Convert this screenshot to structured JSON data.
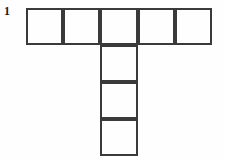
{
  "figure": {
    "label": "1",
    "label_name": "problem-number",
    "caption": "",
    "background_color": "#fefefe",
    "line_color": "#3a3a3a",
    "line_width": 1.6
  },
  "chart_data": {
    "type": "diagram",
    "subtype": "polyomino-net",
    "title": "",
    "xlabel": "",
    "ylabel": "",
    "grid": false,
    "legend": null,
    "cell_size": 37,
    "origin": {
      "x": 26,
      "y": 8
    },
    "xlim": [
      26,
      212
    ],
    "ylim": [
      8,
      156
    ],
    "rows": [
      {
        "name": "top-row",
        "count": 5,
        "row_index": 0,
        "col_start": 0
      },
      {
        "name": "stem-row-1",
        "count": 1,
        "row_index": 1,
        "col_start": 2
      },
      {
        "name": "stem-row-2",
        "count": 1,
        "row_index": 2,
        "col_start": 2
      },
      {
        "name": "stem-row-3",
        "count": 1,
        "row_index": 3,
        "col_start": 2
      }
    ],
    "cells": [
      {
        "id": "cell-r0c0",
        "row": 0,
        "col": 0,
        "x": 26,
        "y": 8,
        "w": 37,
        "h": 37
      },
      {
        "id": "cell-r0c1",
        "row": 0,
        "col": 1,
        "x": 63,
        "y": 8,
        "w": 37,
        "h": 37
      },
      {
        "id": "cell-r0c2",
        "row": 0,
        "col": 2,
        "x": 100,
        "y": 8,
        "w": 38,
        "h": 37
      },
      {
        "id": "cell-r0c3",
        "row": 0,
        "col": 3,
        "x": 138,
        "y": 8,
        "w": 37,
        "h": 37
      },
      {
        "id": "cell-r0c4",
        "row": 0,
        "col": 4,
        "x": 175,
        "y": 8,
        "w": 37,
        "h": 37
      },
      {
        "id": "cell-r1c2",
        "row": 1,
        "col": 2,
        "x": 100,
        "y": 45,
        "w": 38,
        "h": 37
      },
      {
        "id": "cell-r2c2",
        "row": 2,
        "col": 2,
        "x": 100,
        "y": 82,
        "w": 38,
        "h": 37
      },
      {
        "id": "cell-r3c2",
        "row": 3,
        "col": 2,
        "x": 100,
        "y": 119,
        "w": 38,
        "h": 37
      }
    ],
    "total_squares": 8,
    "values": [
      5,
      1,
      1,
      1
    ],
    "categories": [
      "top-row",
      "stem-row-1",
      "stem-row-2",
      "stem-row-3"
    ]
  }
}
